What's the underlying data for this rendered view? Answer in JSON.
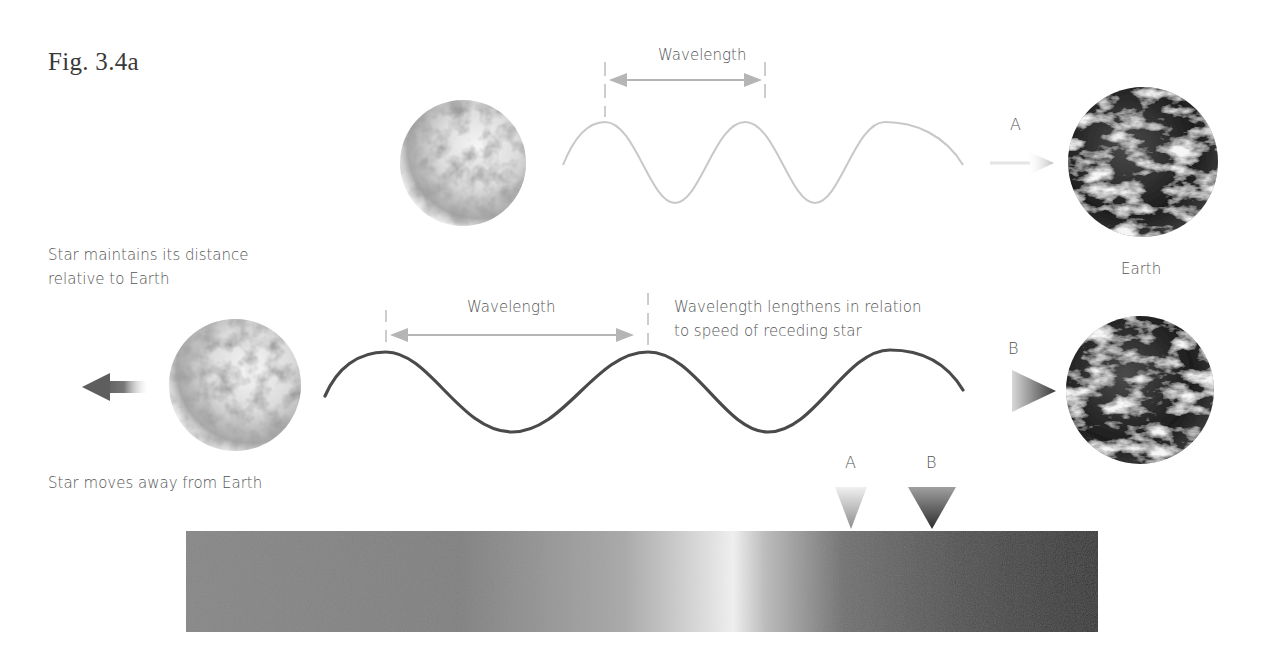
{
  "figure": {
    "label": "Fig. 3.4a"
  },
  "top_row": {
    "wavelength_label": "Wavelength",
    "arrow_letter": "A",
    "earth_label": "Earth"
  },
  "bottom_row": {
    "wavelength_label": "Wavelength",
    "note_line1": "Wavelength lengthens in relation",
    "note_line2": "to speed of receding star",
    "arrow_letter": "B",
    "maintains_line1": "Star maintains its distance",
    "maintains_line2": "relative to Earth",
    "moves_away": "Star moves away from Earth"
  },
  "spectrum": {
    "marker_a": "A",
    "marker_b": "B"
  },
  "colors": {
    "wave_top": "#c8c8c8",
    "wave_bottom": "#4a4a4a",
    "arrow": "#b0b0b0",
    "spectrum_left": "#8a8a8a",
    "spectrum_peak": "#f2f2f2",
    "spectrum_right": "#2e2e2e"
  }
}
